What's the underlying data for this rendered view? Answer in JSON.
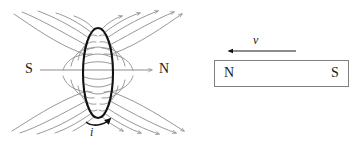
{
  "figure": {
    "colors": {
      "field_line": "#8c8c8c",
      "loop": "#111111",
      "axis": "#8c8c8c",
      "magnet_outline": "#808080",
      "text": "#1a1a1a",
      "background": "#ffffff"
    }
  },
  "left_panel": {
    "name": "current-loop-field-diagram",
    "loop": {
      "current_label": "i",
      "center_x": 98,
      "center_y": 73,
      "radius_x": 15,
      "radius_y": 45
    },
    "axis": {
      "pole_left_label": "S",
      "pole_right_label": "N",
      "y": 70,
      "x_start": 40,
      "x_end": 154,
      "arrow_direction": "right"
    },
    "field_lines": {
      "count": 20,
      "arrow_direction_top": "outward-up",
      "arrow_direction_bottom": "outward-down"
    }
  },
  "right_panel": {
    "name": "bar-magnet-moving-left",
    "velocity": {
      "label": "v",
      "arrow_direction": "left",
      "y": 51,
      "x_tail": 296,
      "x_head": 229
    },
    "magnet": {
      "pole_left_label": "N",
      "pole_right_label": "S",
      "x": 214,
      "y": 60,
      "width": 135,
      "height": 27
    }
  }
}
